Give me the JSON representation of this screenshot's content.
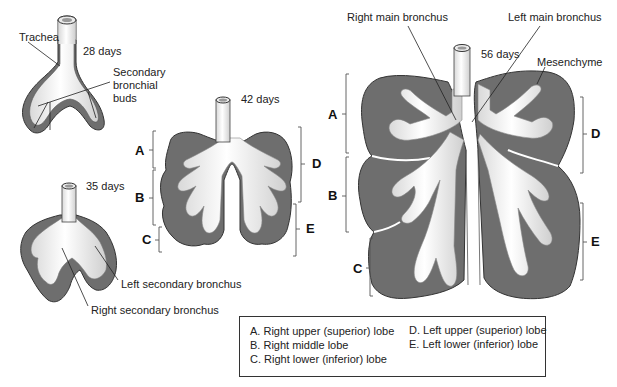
{
  "figure": {
    "stages": [
      {
        "id": "28d",
        "label": "28 days"
      },
      {
        "id": "35d",
        "label": "35 days"
      },
      {
        "id": "42d",
        "label": "42 days"
      },
      {
        "id": "56d",
        "label": "56 days"
      }
    ],
    "annotations": {
      "trachea": "Trachea",
      "secondary_buds_line1": "Secondary",
      "secondary_buds_line2": "bronchial",
      "secondary_buds_line3": "buds",
      "left_secondary_bronchus": "Left secondary bronchus",
      "right_secondary_bronchus": "Right secondary bronchus",
      "right_main_bronchus": "Right main bronchus",
      "left_main_bronchus": "Left main bronchus",
      "mesenchyme": "Mesenchyme"
    },
    "lobe_letters": {
      "a": "A",
      "b": "B",
      "c": "C",
      "d": "D",
      "e": "E"
    },
    "colors": {
      "mesenchyme": "#6e6e6e",
      "epithelium": "#f4f4f4",
      "epithelium_shade": "#c8c8c8",
      "outline": "#3a3a3a"
    }
  },
  "legend": {
    "items": [
      {
        "key": "A.",
        "text": "Right upper (superior) lobe"
      },
      {
        "key": "B.",
        "text": "Right middle lobe"
      },
      {
        "key": "C.",
        "text": "Right lower (inferior) lobe"
      },
      {
        "key": "D.",
        "text": "Left upper (superior) lobe"
      },
      {
        "key": "E.",
        "text": "Left lower (inferior) lobe"
      }
    ]
  }
}
